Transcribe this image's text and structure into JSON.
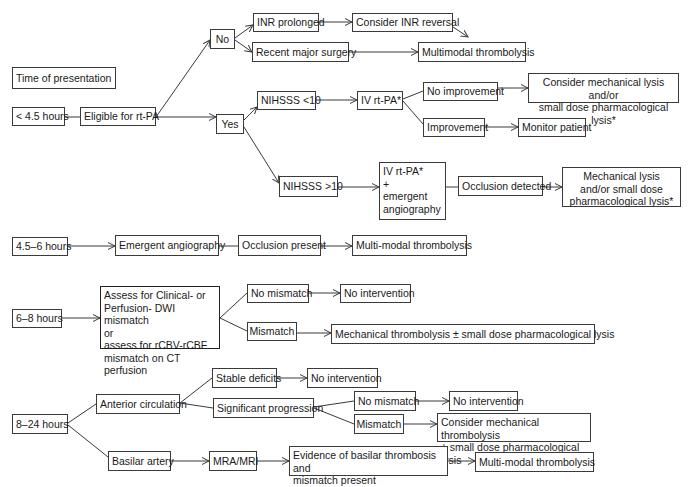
{
  "diagram": {
    "type": "flowchart",
    "legend_label": "Time of presentation",
    "nodes": {
      "time_label": {
        "text": "Time of presentation",
        "x": 12,
        "y": 67,
        "w": 104,
        "h": 22
      },
      "lt45": {
        "text": "< 4.5 hours",
        "x": 12,
        "y": 107,
        "w": 53,
        "h": 19
      },
      "eligible": {
        "text": "Eligible for rt-PA",
        "x": 80,
        "y": 107,
        "w": 76,
        "h": 19
      },
      "no": {
        "text": "No",
        "x": 210,
        "y": 29,
        "w": 25,
        "h": 20
      },
      "inr_prolonged": {
        "text": "INR prolonged",
        "x": 253,
        "y": 13,
        "w": 66,
        "h": 19
      },
      "recent_surgery": {
        "text": "Recent major surgery",
        "x": 252,
        "y": 42,
        "w": 97,
        "h": 20
      },
      "inr_reversal": {
        "text": "Consider INR reversal",
        "x": 352,
        "y": 13,
        "w": 101,
        "h": 19
      },
      "multimodal_1": {
        "text": "Multimodal thrombolysis",
        "x": 418,
        "y": 42,
        "w": 108,
        "h": 20
      },
      "yes": {
        "text": "Yes",
        "x": 216,
        "y": 114,
        "w": 28,
        "h": 20
      },
      "nihsss_lt10": {
        "text": "NIHSSS <10",
        "x": 257,
        "y": 91,
        "w": 59,
        "h": 19
      },
      "ivrtpa_1": {
        "text": "IV rt-PA*",
        "x": 357,
        "y": 91,
        "w": 46,
        "h": 19
      },
      "no_improvement": {
        "text": "No improvement",
        "x": 423,
        "y": 82,
        "w": 75,
        "h": 19
      },
      "consider_mech_lysis": {
        "text": "Consider mechanical lysis and/or\nsmall dose pharmacological lysis*",
        "x": 528,
        "y": 73,
        "w": 151,
        "h": 30
      },
      "improvement": {
        "text": "Improvement",
        "x": 423,
        "y": 118,
        "w": 62,
        "h": 19
      },
      "monitor": {
        "text": "Monitor patient",
        "x": 518,
        "y": 118,
        "w": 68,
        "h": 19
      },
      "nihsss_gt10": {
        "text": "NIHSSS >10",
        "x": 279,
        "y": 176,
        "w": 59,
        "h": 21
      },
      "ivrtpa_angio": {
        "text": "IV rt-PA*\n+\nemergent\nangiography",
        "x": 379,
        "y": 162,
        "w": 67,
        "h": 58
      },
      "occlusion_detected": {
        "text": "Occlusion detected",
        "x": 458,
        "y": 176,
        "w": 85,
        "h": 20
      },
      "mech_lysis": {
        "text": "Mechanical lysis\nand/or small dose\npharmacological lysis*",
        "x": 562,
        "y": 167,
        "w": 119,
        "h": 40
      },
      "h45_6": {
        "text": "4.5–6 hours",
        "x": 12,
        "y": 237,
        "w": 56,
        "h": 19
      },
      "emergent_angio": {
        "text": "Emergent angiography",
        "x": 115,
        "y": 235,
        "w": 104,
        "h": 21
      },
      "occlusion_present": {
        "text": "Occlusion present",
        "x": 238,
        "y": 235,
        "w": 83,
        "h": 21
      },
      "multimodal_2": {
        "text": "Multi-modal thrombolysis",
        "x": 352,
        "y": 235,
        "w": 115,
        "h": 21
      },
      "h6_8": {
        "text": "6–8 hours",
        "x": 12,
        "y": 309,
        "w": 50,
        "h": 19
      },
      "assess": {
        "text": "Assess for Clinical- or\nPerfusion- DWI mismatch\nor\nassess for rCBV-rCBF\nmismatch on CT perfusion",
        "x": 100,
        "y": 286,
        "w": 120,
        "h": 63
      },
      "no_mismatch_1": {
        "text": "No mismatch",
        "x": 247,
        "y": 284,
        "w": 62,
        "h": 19
      },
      "no_intervention_1": {
        "text": "No intervention",
        "x": 340,
        "y": 284,
        "w": 71,
        "h": 19
      },
      "mismatch_1": {
        "text": "Mismatch",
        "x": 247,
        "y": 322,
        "w": 50,
        "h": 19
      },
      "mech_thromb_1": {
        "text": "Mechanical thrombolysis ± small dose pharmacological lysis",
        "x": 331,
        "y": 324,
        "w": 264,
        "h": 20
      },
      "h8_24": {
        "text": "8–24 hours",
        "x": 12,
        "y": 414,
        "w": 56,
        "h": 20
      },
      "anterior": {
        "text": "Anterior circulation",
        "x": 96,
        "y": 394,
        "w": 84,
        "h": 20
      },
      "stable": {
        "text": "Stable deficits",
        "x": 212,
        "y": 368,
        "w": 65,
        "h": 20
      },
      "no_intervention_2": {
        "text": "No intervention",
        "x": 307,
        "y": 368,
        "w": 71,
        "h": 20
      },
      "sig_progression": {
        "text": "Significant progression",
        "x": 213,
        "y": 398,
        "w": 101,
        "h": 20
      },
      "no_mismatch_2": {
        "text": "No mismatch",
        "x": 354,
        "y": 391,
        "w": 62,
        "h": 20
      },
      "no_intervention_3": {
        "text": "No intervention",
        "x": 449,
        "y": 391,
        "w": 69,
        "h": 20
      },
      "mismatch_2": {
        "text": "Mismatch",
        "x": 354,
        "y": 414,
        "w": 50,
        "h": 20
      },
      "consider_mech_thromb": {
        "text": "Consider mechanical thrombolysis\n± small dose pharmacological lysis",
        "x": 437,
        "y": 413,
        "w": 154,
        "h": 29
      },
      "basilar": {
        "text": "Basilar artery",
        "x": 108,
        "y": 451,
        "w": 63,
        "h": 20
      },
      "mra_mri": {
        "text": "MRA/MRI",
        "x": 209,
        "y": 451,
        "w": 48,
        "h": 20
      },
      "evidence_basilar": {
        "text": "Evidence of basilar thrombosis and\nmismatch present",
        "x": 289,
        "y": 446,
        "w": 159,
        "h": 30
      },
      "multimodal_3": {
        "text": "Multi-modal thrombolysis",
        "x": 475,
        "y": 452,
        "w": 119,
        "h": 20
      }
    },
    "edges": [
      {
        "from": "lt45",
        "to": "eligible",
        "arrow": false,
        "pts": [
          [
            65,
            117
          ],
          [
            80,
            117
          ]
        ]
      },
      {
        "from": "eligible",
        "to": "no",
        "arrow": true,
        "pts": [
          [
            156,
            117
          ],
          [
            210,
            40
          ]
        ]
      },
      {
        "from": "eligible",
        "to": "yes",
        "arrow": true,
        "pts": [
          [
            156,
            117
          ],
          [
            216,
            117
          ]
        ]
      },
      {
        "from": "no",
        "to": "inr_prolonged",
        "arrow": true,
        "pts": [
          [
            235,
            38
          ],
          [
            253,
            25
          ]
        ]
      },
      {
        "from": "no",
        "to": "recent_surgery",
        "arrow": true,
        "pts": [
          [
            235,
            40
          ],
          [
            252,
            52
          ]
        ]
      },
      {
        "from": "inr_prolonged",
        "to": "inr_reversal",
        "arrow": true,
        "pts": [
          [
            319,
            22
          ],
          [
            352,
            22
          ]
        ]
      },
      {
        "from": "inr_reversal",
        "to": "multimodal_1",
        "arrow": true,
        "pts": [
          [
            453,
            27
          ],
          [
            468,
            37
          ]
        ]
      },
      {
        "from": "recent_surgery",
        "to": "multimodal_1",
        "arrow": true,
        "pts": [
          [
            349,
            52
          ],
          [
            418,
            52
          ]
        ]
      },
      {
        "from": "yes",
        "to": "nihsss_lt10",
        "arrow": true,
        "pts": [
          [
            244,
            120
          ],
          [
            257,
            107
          ]
        ]
      },
      {
        "from": "yes",
        "to": "nihsss_gt10",
        "arrow": true,
        "pts": [
          [
            244,
            127
          ],
          [
            279,
            183
          ]
        ]
      },
      {
        "from": "nihsss_lt10",
        "to": "ivrtpa_1",
        "arrow": true,
        "pts": [
          [
            316,
            100
          ],
          [
            357,
            100
          ]
        ]
      },
      {
        "from": "ivrtpa_1",
        "to": "no_improvement",
        "arrow": false,
        "pts": [
          [
            403,
            99
          ],
          [
            423,
            91
          ]
        ]
      },
      {
        "from": "ivrtpa_1",
        "to": "improvement",
        "arrow": false,
        "pts": [
          [
            403,
            101
          ],
          [
            423,
            124
          ]
        ]
      },
      {
        "from": "no_improvement",
        "to": "consider_mech_lysis",
        "arrow": true,
        "pts": [
          [
            498,
            88
          ],
          [
            528,
            88
          ]
        ]
      },
      {
        "from": "improvement",
        "to": "monitor",
        "arrow": true,
        "pts": [
          [
            485,
            127
          ],
          [
            518,
            127
          ]
        ]
      },
      {
        "from": "nihsss_gt10",
        "to": "ivrtpa_angio",
        "arrow": true,
        "pts": [
          [
            338,
            187
          ],
          [
            379,
            187
          ]
        ]
      },
      {
        "from": "ivrtpa_angio",
        "to": "occlusion_detected",
        "arrow": false,
        "pts": [
          [
            446,
            187
          ],
          [
            458,
            187
          ]
        ]
      },
      {
        "from": "occlusion_detected",
        "to": "mech_lysis",
        "arrow": true,
        "pts": [
          [
            543,
            187
          ],
          [
            562,
            187
          ]
        ]
      },
      {
        "from": "h45_6",
        "to": "emergent_angio",
        "arrow": true,
        "pts": [
          [
            68,
            246
          ],
          [
            115,
            246
          ]
        ]
      },
      {
        "from": "emergent_angio",
        "to": "occlusion_present",
        "arrow": false,
        "pts": [
          [
            219,
            246
          ],
          [
            238,
            246
          ]
        ]
      },
      {
        "from": "occlusion_present",
        "to": "multimodal_2",
        "arrow": true,
        "pts": [
          [
            321,
            246
          ],
          [
            352,
            246
          ]
        ]
      },
      {
        "from": "h6_8",
        "to": "assess",
        "arrow": true,
        "pts": [
          [
            62,
            318
          ],
          [
            100,
            318
          ]
        ]
      },
      {
        "from": "assess",
        "to": "no_mismatch_1",
        "arrow": false,
        "pts": [
          [
            220,
            318
          ],
          [
            247,
            293
          ]
        ]
      },
      {
        "from": "assess",
        "to": "mismatch_1",
        "arrow": false,
        "pts": [
          [
            220,
            318
          ],
          [
            247,
            331
          ]
        ]
      },
      {
        "from": "no_mismatch_1",
        "to": "no_intervention_1",
        "arrow": true,
        "pts": [
          [
            309,
            293
          ],
          [
            340,
            293
          ]
        ]
      },
      {
        "from": "mismatch_1",
        "to": "mech_thromb_1",
        "arrow": true,
        "pts": [
          [
            297,
            333
          ],
          [
            331,
            333
          ]
        ]
      },
      {
        "from": "h8_24",
        "to": "anterior",
        "arrow": false,
        "pts": [
          [
            68,
            423
          ],
          [
            96,
            404
          ]
        ]
      },
      {
        "from": "h8_24",
        "to": "basilar",
        "arrow": false,
        "pts": [
          [
            68,
            425
          ],
          [
            108,
            457
          ]
        ]
      },
      {
        "from": "anterior",
        "to": "stable",
        "arrow": false,
        "pts": [
          [
            180,
            403
          ],
          [
            212,
            378
          ]
        ]
      },
      {
        "from": "anterior",
        "to": "sig_progression",
        "arrow": false,
        "pts": [
          [
            180,
            403
          ],
          [
            213,
            408
          ]
        ]
      },
      {
        "from": "stable",
        "to": "no_intervention_2",
        "arrow": true,
        "pts": [
          [
            277,
            378
          ],
          [
            307,
            378
          ]
        ]
      },
      {
        "from": "sig_progression",
        "to": "no_mismatch_2",
        "arrow": false,
        "pts": [
          [
            314,
            407
          ],
          [
            354,
            401
          ]
        ]
      },
      {
        "from": "sig_progression",
        "to": "mismatch_2",
        "arrow": false,
        "pts": [
          [
            314,
            408
          ],
          [
            354,
            424
          ]
        ]
      },
      {
        "from": "no_mismatch_2",
        "to": "no_intervention_3",
        "arrow": true,
        "pts": [
          [
            416,
            401
          ],
          [
            449,
            401
          ]
        ]
      },
      {
        "from": "mismatch_2",
        "to": "consider_mech_thromb",
        "arrow": true,
        "pts": [
          [
            404,
            424
          ],
          [
            437,
            424
          ]
        ]
      },
      {
        "from": "basilar",
        "to": "mra_mri",
        "arrow": true,
        "pts": [
          [
            171,
            461
          ],
          [
            209,
            461
          ]
        ]
      },
      {
        "from": "mra_mri",
        "to": "evidence_basilar",
        "arrow": true,
        "pts": [
          [
            257,
            461
          ],
          [
            289,
            461
          ]
        ]
      },
      {
        "from": "evidence_basilar",
        "to": "multimodal_3",
        "arrow": true,
        "pts": [
          [
            448,
            461
          ],
          [
            475,
            461
          ]
        ]
      }
    ],
    "styles": {
      "line_color": "#3a3a3a",
      "box_border": "#3a3a3a",
      "background": "#ffffff"
    }
  }
}
